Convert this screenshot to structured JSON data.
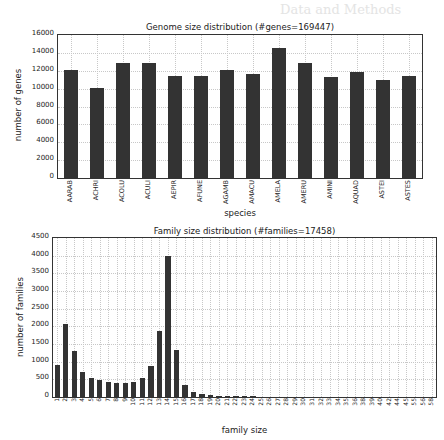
{
  "background_text": "Data and Methods",
  "chart_data": [
    {
      "type": "bar",
      "title": "Genome size distribution (#genes=169447)",
      "xlabel": "species",
      "ylabel": "number of genes",
      "ylim": [
        0,
        16000
      ],
      "yticks": [
        0,
        2000,
        4000,
        6000,
        8000,
        10000,
        12000,
        14000,
        16000
      ],
      "grid": true,
      "categories": [
        "AARAB",
        "ACHRI",
        "ACOLU",
        "ACULI",
        "AEPIR",
        "AFUNE",
        "AGAMB",
        "AMACU",
        "AMELA",
        "AMERU",
        "AMINI",
        "AQUAD",
        "ASTEI",
        "ASTES"
      ],
      "values": [
        12150,
        10100,
        13000,
        13000,
        11500,
        11500,
        12150,
        11750,
        14650,
        13000,
        11350,
        12000,
        11000,
        11550
      ],
      "bar_color": "#333333"
    },
    {
      "type": "bar",
      "title": "Family size distribution (#families=17458)",
      "xlabel": "family size",
      "ylabel": "number of families",
      "ylim": [
        0,
        4500
      ],
      "yticks": [
        0,
        500,
        1000,
        1500,
        2000,
        2500,
        3000,
        3500,
        4000,
        4500
      ],
      "grid": true,
      "categories": [
        "1",
        "2",
        "3",
        "4",
        "5",
        "6",
        "7",
        "8",
        "9",
        "10",
        "11",
        "12",
        "13",
        "14",
        "15",
        "16",
        "17",
        "18",
        "19",
        "20",
        "21",
        "22",
        "23",
        "24",
        "25",
        "26",
        "27",
        "28",
        "29",
        "30",
        "31",
        "32",
        "33",
        "34",
        "35",
        "36",
        "38",
        "39",
        "40",
        "42",
        "44",
        "45",
        "55",
        "56",
        "58"
      ],
      "values": [
        900,
        2080,
        1300,
        700,
        540,
        480,
        420,
        400,
        400,
        440,
        540,
        880,
        1870,
        4020,
        1350,
        350,
        150,
        80,
        50,
        40,
        30,
        25,
        20,
        15,
        12,
        10,
        8,
        6,
        5,
        4,
        3,
        3,
        2,
        2,
        2,
        1,
        1,
        1,
        1,
        1,
        1,
        1,
        1,
        1,
        1
      ],
      "bar_color": "#333333"
    }
  ]
}
